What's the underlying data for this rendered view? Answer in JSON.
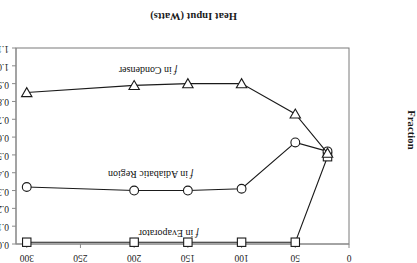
{
  "chart_data": {
    "type": "line",
    "title": "",
    "xlabel": "Heat Input (Watts)",
    "ylabel": "Fraction",
    "xlim": [
      0,
      310
    ],
    "ylim": [
      0.0,
      1.1
    ],
    "y_inverted": true,
    "grid": false,
    "legend_position": "inline-annotations",
    "xticks": [
      0,
      50,
      100,
      150,
      200,
      250,
      300
    ],
    "xtick_labels": [
      "0",
      "50",
      "100",
      "150",
      "200",
      "250",
      "300"
    ],
    "yticks": [
      0.0,
      0.1,
      0.2,
      0.3,
      0.4,
      0.5,
      0.6,
      0.7,
      0.8,
      0.9,
      1.0,
      1.1
    ],
    "ytick_labels": [
      "0.0",
      "0.1",
      "0.2",
      "0.3",
      "0.4",
      "0.5",
      "0.6",
      "0.7",
      "0.8",
      "0.9",
      "1.0",
      "1.1"
    ],
    "series": [
      {
        "name": "f in Evaporator",
        "marker": "square",
        "x": [
          20,
          50,
          100,
          150,
          200,
          300
        ],
        "values": [
          0.49,
          0.01,
          0.01,
          0.01,
          0.01,
          0.01
        ]
      },
      {
        "name": "f in Adiabatic Region",
        "marker": "circle",
        "x": [
          20,
          50,
          100,
          150,
          200,
          300
        ],
        "values": [
          0.52,
          0.57,
          0.31,
          0.3,
          0.3,
          0.32
        ]
      },
      {
        "name": "f in Condenser",
        "marker": "triangle-down",
        "x": [
          20,
          50,
          100,
          150,
          200,
          300
        ],
        "values": [
          0.51,
          0.73,
          0.9,
          0.9,
          0.89,
          0.85
        ]
      }
    ],
    "annotations": [
      {
        "name": "f in Evaporator",
        "prefix": "f",
        "suffix": " in Evaporator",
        "x": 140,
        "y": 0.07
      },
      {
        "name": "f in Adiabatic Region",
        "prefix": "f",
        "suffix": " in Adiabatic Region",
        "x": 145,
        "y": 0.4
      },
      {
        "name": "f in Condenser",
        "prefix": "f",
        "suffix": " in Condenser",
        "x": 160,
        "y": 0.98
      }
    ],
    "colors": {
      "line": "#1a1a1a",
      "marker_face": "#ffffff",
      "marker_edge": "#1a1a1a",
      "frame": "#7a7a7a",
      "axis": "#8a8a8a",
      "text": "#1a1a1a"
    }
  }
}
